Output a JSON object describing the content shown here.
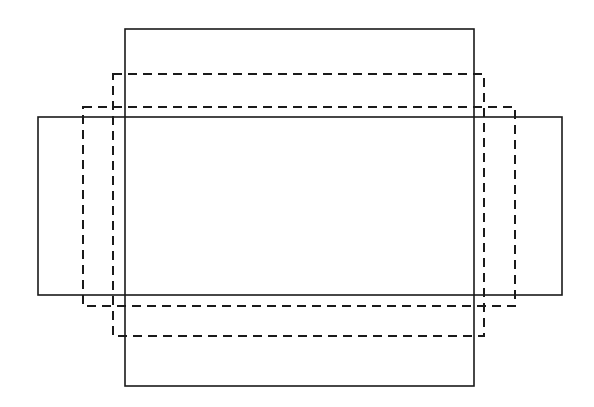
{
  "diagram": {
    "background": "#ffffff",
    "stroke_color": "#1a1a1a",
    "rectangles": [
      {
        "name": "tall-solid-rect",
        "style": "solid",
        "x": 125,
        "y": 29,
        "w": 349,
        "h": 357
      },
      {
        "name": "wide-solid-rect",
        "style": "solid",
        "x": 38,
        "y": 117,
        "w": 524,
        "h": 178
      },
      {
        "name": "tall-dashed-rect",
        "style": "dashed",
        "x": 113,
        "y": 74,
        "w": 371,
        "h": 262
      },
      {
        "name": "wide-dashed-rect",
        "style": "dashed",
        "x": 83,
        "y": 107,
        "w": 432,
        "h": 199
      }
    ]
  }
}
